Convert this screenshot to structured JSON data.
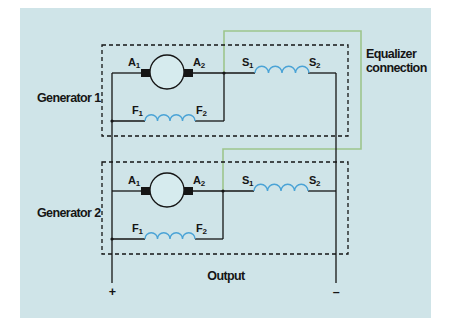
{
  "diagram": {
    "type": "parallel compound DC generators with equalizer connection",
    "colors": {
      "background": "#cfe4e8",
      "wire": "#151515",
      "coil": "#4aa3d6",
      "equalizer": "#9dc58c",
      "dashed_box": "#151515"
    },
    "generators": [
      {
        "label": "Generator 1",
        "armature": {
          "left": "A",
          "left_sub": "1",
          "right": "A",
          "right_sub": "2"
        },
        "shunt_field": {
          "left": "F",
          "left_sub": "1",
          "right": "F",
          "right_sub": "2"
        },
        "series_field": {
          "left": "S",
          "left_sub": "1",
          "right": "S",
          "right_sub": "2"
        }
      },
      {
        "label": "Generator 2",
        "armature": {
          "left": "A",
          "left_sub": "1",
          "right": "A",
          "right_sub": "2"
        },
        "shunt_field": {
          "left": "F",
          "left_sub": "1",
          "right": "F",
          "right_sub": "2"
        },
        "series_field": {
          "left": "S",
          "left_sub": "1",
          "right": "S",
          "right_sub": "2"
        }
      }
    ],
    "equalizer_label_line1": "Equalizer",
    "equalizer_label_line2": "connection",
    "output_label": "Output",
    "positive_terminal": "+",
    "negative_terminal": "–"
  }
}
